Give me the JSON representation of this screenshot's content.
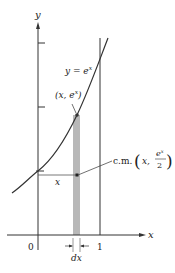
{
  "axes": {
    "x_label": "x",
    "y_label": "y",
    "origin_label": "0",
    "x_tick_1_label": "1"
  },
  "curve": {
    "label": "y = e",
    "label_exp": "x",
    "color": "#333333"
  },
  "point_label": {
    "open": "(x,  e",
    "exp": "x",
    "close": ")"
  },
  "center_of_mass": {
    "prefix": "c.m.",
    "x": "x,",
    "numerator": "e",
    "numerator_exp": "x",
    "denominator": "2"
  },
  "strip": {
    "width_label": "dx",
    "color": "#b8b8b8"
  },
  "distance_label": "x"
}
